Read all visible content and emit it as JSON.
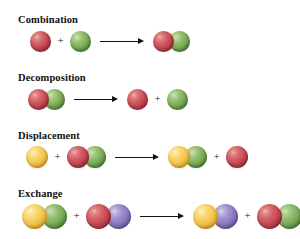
{
  "figure": {
    "name": "types-of-chemical-reactions",
    "background_color": "#ffffff",
    "width": 300,
    "height": 239
  },
  "palette": {
    "red": "#c54a55",
    "green": "#7cab59",
    "yellow": "#f0c54c",
    "purple": "#8b7cbe",
    "arrow": "#111111",
    "text": "#111111"
  },
  "symbols": {
    "plus": "+",
    "arrow": "→"
  },
  "rows": [
    {
      "label": "Combination",
      "reactants": [
        {
          "spheres": [
            "red"
          ]
        },
        {
          "spheres": [
            "green"
          ]
        }
      ],
      "products": [
        {
          "spheres": [
            "red",
            "green"
          ]
        }
      ]
    },
    {
      "label": "Decomposition",
      "reactants": [
        {
          "spheres": [
            "red",
            "green"
          ]
        }
      ],
      "products": [
        {
          "spheres": [
            "red"
          ]
        },
        {
          "spheres": [
            "green"
          ]
        }
      ]
    },
    {
      "label": "Displacement",
      "reactants": [
        {
          "spheres": [
            "yellow"
          ]
        },
        {
          "spheres": [
            "red",
            "green"
          ]
        }
      ],
      "products": [
        {
          "spheres": [
            "yellow",
            "green"
          ]
        },
        {
          "spheres": [
            "red"
          ]
        }
      ]
    },
    {
      "label": "Exchange",
      "reactants": [
        {
          "spheres": [
            "yellow",
            "green"
          ]
        },
        {
          "spheres": [
            "red",
            "purple"
          ]
        }
      ],
      "products": [
        {
          "spheres": [
            "yellow",
            "purple"
          ]
        },
        {
          "spheres": [
            "red",
            "green"
          ]
        }
      ]
    }
  ],
  "layout": {
    "label_x": 18,
    "label_y": [
      14,
      72,
      130,
      188
    ],
    "row_center_y": [
      41,
      99,
      157,
      216
    ],
    "sphere_diameter": [
      21,
      21,
      22,
      25
    ],
    "equation_start_x": [
      30,
      28,
      26,
      22
    ]
  }
}
